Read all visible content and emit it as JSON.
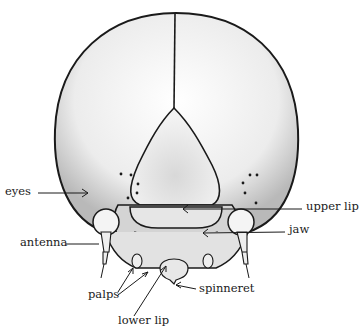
{
  "diagram": {
    "labels": {
      "eyes": "eyes",
      "antenna": "antenna",
      "palps": "palps",
      "lower_lip": "lower lip",
      "spinneret": "spinneret",
      "upper_lip": "upper lip",
      "jaw": "jaw"
    },
    "colors": {
      "outline": "#1a1a1a",
      "shade": "#c8c8c8",
      "light": "#f2f2f2",
      "background": "#ffffff"
    }
  }
}
